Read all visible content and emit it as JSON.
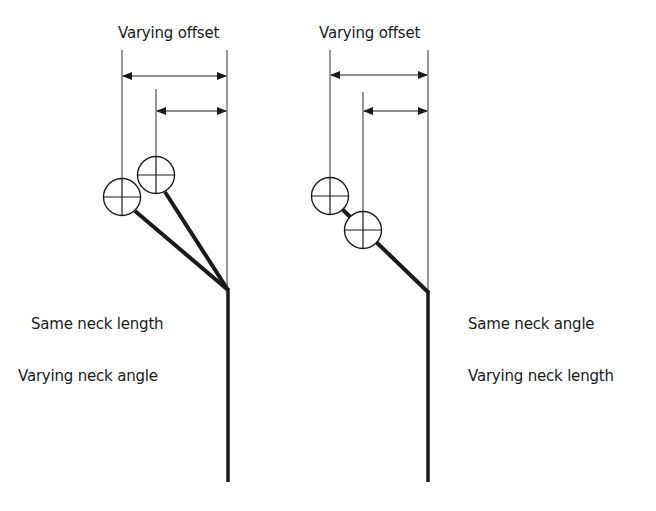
{
  "figure": {
    "colors": {
      "stroke": "#1a1a1a",
      "thin_line": "#333333",
      "background": "#ffffff"
    }
  },
  "panels": [
    {
      "id": "left",
      "title": "Varying offset",
      "labels": [
        "Same neck length",
        "Varying neck angle"
      ],
      "heads": 2
    },
    {
      "id": "right",
      "title": "Varying offset",
      "labels": [
        "Same neck angle",
        "Varying neck length"
      ],
      "heads": 2
    }
  ]
}
